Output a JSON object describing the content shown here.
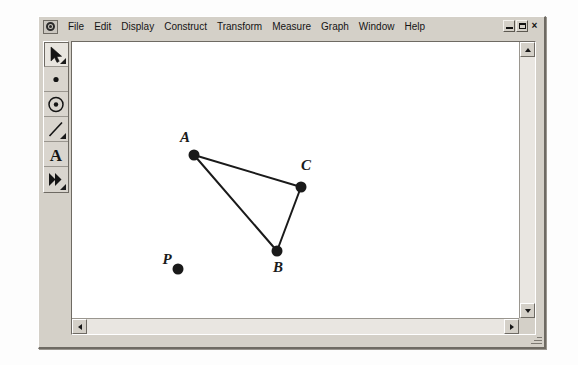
{
  "window": {
    "app_icon": "sketchpad-app-icon",
    "controls": [
      {
        "name": "minimize",
        "label": "_",
        "icon": "minimize-icon"
      },
      {
        "name": "restore",
        "label": "",
        "icon": "restore-icon"
      },
      {
        "name": "close",
        "label": "×",
        "icon": "close-icon"
      }
    ]
  },
  "menubar": {
    "items": [
      {
        "label": "File"
      },
      {
        "label": "Edit"
      },
      {
        "label": "Display"
      },
      {
        "label": "Construct"
      },
      {
        "label": "Transform"
      },
      {
        "label": "Measure"
      },
      {
        "label": "Graph"
      },
      {
        "label": "Window"
      },
      {
        "label": "Help"
      }
    ]
  },
  "toolbar": {
    "tools": [
      {
        "name": "selection-arrow-tool",
        "icon": "arrow-icon",
        "title": "Selection Arrow Tool",
        "active": true,
        "has_popup": true
      },
      {
        "name": "point-tool",
        "icon": "point-icon",
        "title": "Point Tool",
        "active": false,
        "has_popup": false
      },
      {
        "name": "compass-circle-tool",
        "icon": "circle-icon",
        "title": "Compass Tool",
        "active": false,
        "has_popup": false
      },
      {
        "name": "straightedge-tool",
        "icon": "line-segment-icon",
        "title": "Straightedge Tool",
        "active": false,
        "has_popup": true
      },
      {
        "name": "text-tool",
        "icon": "letter-a-icon",
        "title": "Text Tool",
        "active": false,
        "has_popup": false
      },
      {
        "name": "custom-tool",
        "icon": "double-arrow-icon",
        "title": "Custom Tool",
        "active": false,
        "has_popup": true
      }
    ]
  },
  "canvas": {
    "background": "#ffffff",
    "ink_color": "#1a1a1a",
    "point_radius": 5.5,
    "line_width": 2,
    "points": [
      {
        "id": "A",
        "label": "A",
        "x": 122,
        "y": 113,
        "label_x": 113,
        "label_y": 100
      },
      {
        "id": "B",
        "label": "B",
        "x": 205,
        "y": 209,
        "label_x": 206,
        "label_y": 230
      },
      {
        "id": "C",
        "label": "C",
        "x": 229,
        "y": 145,
        "label_x": 234,
        "label_y": 128
      },
      {
        "id": "P",
        "label": "P",
        "x": 106,
        "y": 227,
        "label_x": 95,
        "label_y": 222
      }
    ],
    "segments": [
      {
        "from": "A",
        "to": "C"
      },
      {
        "from": "A",
        "to": "B"
      },
      {
        "from": "B",
        "to": "C"
      }
    ]
  },
  "scrollbars": {
    "vertical": {
      "up": "scroll-up-arrow",
      "down": "scroll-down-arrow"
    },
    "horizontal": {
      "left": "scroll-left-arrow",
      "right": "scroll-right-arrow"
    }
  }
}
